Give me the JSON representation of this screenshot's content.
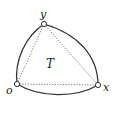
{
  "diagram": {
    "type": "curved-triangle",
    "colors": {
      "stroke": "#333333",
      "dotted": "#555555",
      "vertex_fill": "#ffffff",
      "text": "#222222"
    },
    "vertices": {
      "y": {
        "label": "y",
        "x": 44,
        "y": 24
      },
      "o": {
        "label": "o",
        "x": 17,
        "y": 84
      },
      "x": {
        "label": "x",
        "x": 98,
        "y": 85
      }
    },
    "region_label": "T",
    "edges": [
      {
        "from": "o",
        "to": "y",
        "style": "curved-solid"
      },
      {
        "from": "y",
        "to": "x",
        "style": "curved-solid"
      },
      {
        "from": "o",
        "to": "x",
        "style": "curved-solid"
      },
      {
        "from": "o",
        "to": "y",
        "style": "straight-dotted"
      },
      {
        "from": "y",
        "to": "x",
        "style": "straight-dotted"
      },
      {
        "from": "o",
        "to": "x",
        "style": "straight-dotted"
      }
    ]
  }
}
